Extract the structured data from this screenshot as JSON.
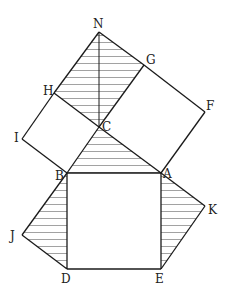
{
  "diagram": {
    "type": "geometry-figure",
    "points": {
      "N": [
        99,
        32
      ],
      "G": [
        144,
        65
      ],
      "F": [
        205,
        112
      ],
      "H": [
        54,
        93
      ],
      "I": [
        22,
        139
      ],
      "C": [
        99,
        127
      ],
      "B": [
        67,
        173
      ],
      "A": [
        161,
        173
      ],
      "K": [
        205,
        206
      ],
      "J": [
        22,
        235
      ],
      "D": [
        67,
        269
      ],
      "E": [
        161,
        269
      ]
    },
    "labels": [
      {
        "text": "N",
        "x": 93,
        "y": 28
      },
      {
        "text": "G",
        "x": 146,
        "y": 64
      },
      {
        "text": "F",
        "x": 206,
        "y": 110
      },
      {
        "text": "H",
        "x": 43,
        "y": 95
      },
      {
        "text": "I",
        "x": 14,
        "y": 142
      },
      {
        "text": "C",
        "x": 102,
        "y": 131
      },
      {
        "text": "B",
        "x": 55,
        "y": 180
      },
      {
        "text": "A",
        "x": 163,
        "y": 178
      },
      {
        "text": "K",
        "x": 208,
        "y": 214
      },
      {
        "text": "J",
        "x": 10,
        "y": 240
      },
      {
        "text": "D",
        "x": 61,
        "y": 283
      },
      {
        "text": "E",
        "x": 155,
        "y": 283
      }
    ],
    "segments": [
      [
        "N",
        "G"
      ],
      [
        "G",
        "F"
      ],
      [
        "F",
        "A"
      ],
      [
        "A",
        "C"
      ],
      [
        "C",
        "G"
      ],
      [
        "N",
        "H"
      ],
      [
        "H",
        "I"
      ],
      [
        "I",
        "B"
      ],
      [
        "B",
        "C"
      ],
      [
        "C",
        "H"
      ],
      [
        "N",
        "C"
      ],
      [
        "B",
        "A"
      ],
      [
        "A",
        "E"
      ],
      [
        "E",
        "D"
      ],
      [
        "D",
        "B"
      ],
      [
        "B",
        "J"
      ],
      [
        "J",
        "D"
      ],
      [
        "A",
        "K"
      ],
      [
        "K",
        "E"
      ]
    ],
    "hatched_regions": [
      {
        "name": "parallelogram-NHCG",
        "points": [
          "N",
          "H",
          "C",
          "G"
        ]
      },
      {
        "name": "triangle-CBA",
        "points": [
          "C",
          "B",
          "A"
        ]
      },
      {
        "name": "triangle-BJD",
        "points": [
          "B",
          "J",
          "D"
        ]
      },
      {
        "name": "triangle-AKE",
        "points": [
          "A",
          "K",
          "E"
        ]
      }
    ],
    "hatch_spacing": 7,
    "colors": {
      "line": "#1a1a1a",
      "hatch": "#8a8a8a",
      "background": "#ffffff"
    }
  }
}
